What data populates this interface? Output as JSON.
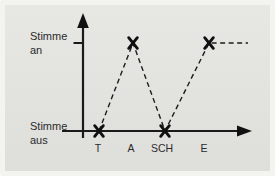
{
  "chart_data": {
    "type": "line",
    "categories": [
      "T",
      "A",
      "SCH",
      "E"
    ],
    "values": [
      0,
      1,
      0,
      1
    ],
    "y_tick_labels": [
      {
        "value": 1,
        "label": "Stimme an",
        "lines": [
          "Stimme",
          "an"
        ]
      },
      {
        "value": 0,
        "label": "Stimme aus",
        "lines": [
          "Stimme",
          "aus"
        ]
      }
    ],
    "ylim": [
      0,
      1
    ],
    "xlabel": "",
    "ylabel": "",
    "title": "",
    "grid": false,
    "legend_position": "none",
    "line_style": "dashed",
    "marker": "x",
    "continues_right": true,
    "series": [
      {
        "name": "voicing",
        "points": [
          {
            "category": "T",
            "state": "Stimme aus"
          },
          {
            "category": "A",
            "state": "Stimme an"
          },
          {
            "category": "SCH",
            "state": "Stimme aus"
          },
          {
            "category": "E",
            "state": "Stimme an"
          }
        ]
      }
    ]
  },
  "icons": {
    "y_axis_arrow": "arrow-up",
    "x_axis_arrow": "arrow-right",
    "data_marker": "x-cross"
  },
  "colors": {
    "background": "#e2e2df",
    "frame": "#f3f3f0",
    "line": "#1c1c1c",
    "text": "#2b2b2b"
  }
}
